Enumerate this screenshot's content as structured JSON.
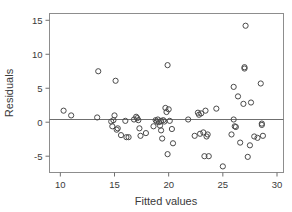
{
  "chart_data": {
    "type": "scatter",
    "title": "",
    "xlabel": "Fitted values",
    "ylabel": "Residuals",
    "xlim": [
      9.0,
      30.6
    ],
    "ylim": [
      -7.4,
      16.0
    ],
    "xticks": [
      10,
      15,
      20,
      25,
      30
    ],
    "yticks": [
      -5,
      0,
      5,
      10,
      15
    ],
    "xtick_labels": [
      "10",
      "15",
      "20",
      "25",
      "30"
    ],
    "ytick_labels": [
      "-5",
      "0",
      "5",
      "10",
      "15"
    ],
    "grid": false,
    "legend": null,
    "reference_line": {
      "orientation": "horizontal",
      "y": 0.4
    },
    "marker": {
      "shape": "open-circle",
      "radius": 2.6,
      "color": "#4a4a4a"
    },
    "series": [
      {
        "name": "residuals",
        "points": [
          [
            10.3,
            1.7
          ],
          [
            11.0,
            1.0
          ],
          [
            13.4,
            0.7
          ],
          [
            13.5,
            7.5
          ],
          [
            14.7,
            0.1
          ],
          [
            14.8,
            -0.6
          ],
          [
            14.9,
            0.3
          ],
          [
            15.0,
            1.0
          ],
          [
            15.1,
            6.1
          ],
          [
            15.2,
            -1.1
          ],
          [
            15.3,
            -0.9
          ],
          [
            15.6,
            -1.9
          ],
          [
            16.0,
            0.2
          ],
          [
            16.1,
            -2.2
          ],
          [
            16.3,
            -2.2
          ],
          [
            16.8,
            0.4
          ],
          [
            17.0,
            0.8
          ],
          [
            17.1,
            0.6
          ],
          [
            17.2,
            0.3
          ],
          [
            17.3,
            -0.9
          ],
          [
            17.4,
            -2.0
          ],
          [
            17.9,
            -1.6
          ],
          [
            18.6,
            -0.6
          ],
          [
            18.8,
            0.3
          ],
          [
            18.9,
            0.1
          ],
          [
            19.0,
            0.4
          ],
          [
            19.1,
            0.0
          ],
          [
            19.2,
            -0.5
          ],
          [
            19.3,
            0.2
          ],
          [
            19.3,
            -1.2
          ],
          [
            19.4,
            -2.4
          ],
          [
            19.5,
            0.3
          ],
          [
            19.6,
            0.1
          ],
          [
            19.7,
            2.1
          ],
          [
            19.8,
            1.5
          ],
          [
            19.9,
            8.4
          ],
          [
            19.9,
            -4.7
          ],
          [
            20.0,
            1.9
          ],
          [
            20.1,
            0.2
          ],
          [
            20.3,
            -1.0
          ],
          [
            20.4,
            -3.1
          ],
          [
            21.8,
            0.4
          ],
          [
            22.4,
            -2.0
          ],
          [
            22.7,
            1.4
          ],
          [
            22.8,
            1.1
          ],
          [
            22.9,
            -1.7
          ],
          [
            23.0,
            1.3
          ],
          [
            23.2,
            -1.5
          ],
          [
            23.3,
            -5.0
          ],
          [
            23.4,
            1.7
          ],
          [
            23.5,
            -2.1
          ],
          [
            23.6,
            -1.8
          ],
          [
            23.7,
            -5.0
          ],
          [
            24.4,
            2.0
          ],
          [
            25.0,
            -6.5
          ],
          [
            25.8,
            -1.8
          ],
          [
            26.0,
            5.2
          ],
          [
            26.0,
            0.4
          ],
          [
            26.1,
            -0.6
          ],
          [
            26.2,
            -0.7
          ],
          [
            26.4,
            3.8
          ],
          [
            26.6,
            -3.0
          ],
          [
            26.9,
            2.7
          ],
          [
            27.0,
            8.1
          ],
          [
            27.0,
            7.9
          ],
          [
            27.1,
            14.2
          ],
          [
            27.3,
            -5.1
          ],
          [
            27.5,
            -3.4
          ],
          [
            27.6,
            2.9
          ],
          [
            27.9,
            -2.1
          ],
          [
            28.2,
            -2.3
          ],
          [
            28.5,
            5.7
          ],
          [
            28.6,
            -0.2
          ],
          [
            28.6,
            -0.4
          ],
          [
            28.7,
            -2.0
          ]
        ]
      }
    ]
  },
  "figure": {
    "background_color": "#ffffff",
    "frame_color": "#8d8d8d",
    "text_color": "#3a3a3a"
  }
}
